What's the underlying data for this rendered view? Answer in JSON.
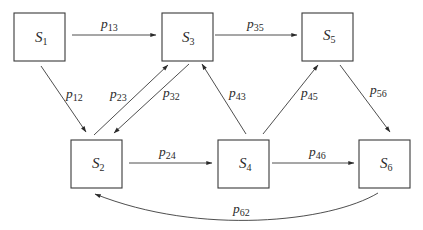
{
  "diagram": {
    "type": "state-transition",
    "states": [
      {
        "id": "S1",
        "base": "S",
        "sub": "1"
      },
      {
        "id": "S2",
        "base": "S",
        "sub": "2"
      },
      {
        "id": "S3",
        "base": "S",
        "sub": "3"
      },
      {
        "id": "S4",
        "base": "S",
        "sub": "4"
      },
      {
        "id": "S5",
        "base": "S",
        "sub": "5"
      },
      {
        "id": "S6",
        "base": "S",
        "sub": "6"
      }
    ],
    "transitions": [
      {
        "from": "S1",
        "to": "S3",
        "base": "p",
        "sub": "13"
      },
      {
        "from": "S1",
        "to": "S2",
        "base": "p",
        "sub": "12"
      },
      {
        "from": "S2",
        "to": "S3",
        "base": "p",
        "sub": "23"
      },
      {
        "from": "S3",
        "to": "S2",
        "base": "p",
        "sub": "32"
      },
      {
        "from": "S3",
        "to": "S5",
        "base": "p",
        "sub": "35"
      },
      {
        "from": "S4",
        "to": "S3",
        "base": "p",
        "sub": "43"
      },
      {
        "from": "S4",
        "to": "S5",
        "base": "p",
        "sub": "45"
      },
      {
        "from": "S5",
        "to": "S6",
        "base": "p",
        "sub": "56"
      },
      {
        "from": "S2",
        "to": "S4",
        "base": "p",
        "sub": "24"
      },
      {
        "from": "S4",
        "to": "S6",
        "base": "p",
        "sub": "46"
      },
      {
        "from": "S6",
        "to": "S2",
        "base": "p",
        "sub": "62"
      }
    ],
    "colors": {
      "stroke": "#3a3a3a",
      "text": "#2a2a2a",
      "background": "#ffffff"
    }
  }
}
